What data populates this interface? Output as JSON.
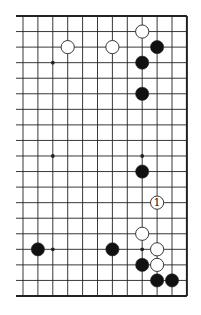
{
  "board": {
    "columns": 12,
    "rows": 19,
    "origin_x": 23,
    "origin_y": 16,
    "spacing_x": 14.9,
    "spacing_y": 15.555,
    "left_edge_open": true,
    "line_extension_left": 7,
    "line_color": "#222222",
    "border_width": 2,
    "line_width": 0.9
  },
  "star_points": [
    {
      "col": 2,
      "row": 3
    },
    {
      "col": 2,
      "row": 9
    },
    {
      "col": 8,
      "row": 9
    },
    {
      "col": 2,
      "row": 15
    },
    {
      "col": 8,
      "row": 15
    }
  ],
  "stones": [
    {
      "color": "white",
      "col": 8,
      "row": 1,
      "label": ""
    },
    {
      "color": "white",
      "col": 3,
      "row": 2,
      "label": ""
    },
    {
      "color": "white",
      "col": 6,
      "row": 2,
      "label": ""
    },
    {
      "color": "black",
      "col": 9,
      "row": 2,
      "label": ""
    },
    {
      "color": "black",
      "col": 8,
      "row": 3,
      "label": ""
    },
    {
      "color": "black",
      "col": 8,
      "row": 5,
      "label": ""
    },
    {
      "color": "black",
      "col": 8,
      "row": 10,
      "label": ""
    },
    {
      "color": "white",
      "col": 9,
      "row": 12,
      "label": "1"
    },
    {
      "color": "white",
      "col": 8,
      "row": 14,
      "label": ""
    },
    {
      "color": "black",
      "col": 1,
      "row": 15,
      "label": ""
    },
    {
      "color": "black",
      "col": 6,
      "row": 15,
      "label": ""
    },
    {
      "color": "white",
      "col": 9,
      "row": 15,
      "label": ""
    },
    {
      "color": "black",
      "col": 8,
      "row": 16,
      "label": ""
    },
    {
      "color": "white",
      "col": 9,
      "row": 16,
      "label": ""
    },
    {
      "color": "black",
      "col": 9,
      "row": 17,
      "label": ""
    },
    {
      "color": "black",
      "col": 10,
      "row": 17,
      "label": ""
    }
  ],
  "colors": {
    "black_stone": "#111111",
    "white_stone": "#ffffff",
    "stone_outline": "#222222",
    "label": "#111111"
  }
}
